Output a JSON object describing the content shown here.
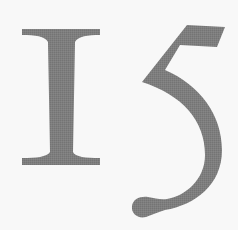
{
  "glyphs": {
    "text": "I5",
    "first": "I",
    "second": "5"
  },
  "colors": {
    "background": "#f8f8f8",
    "ink": "#7b7b7b"
  }
}
